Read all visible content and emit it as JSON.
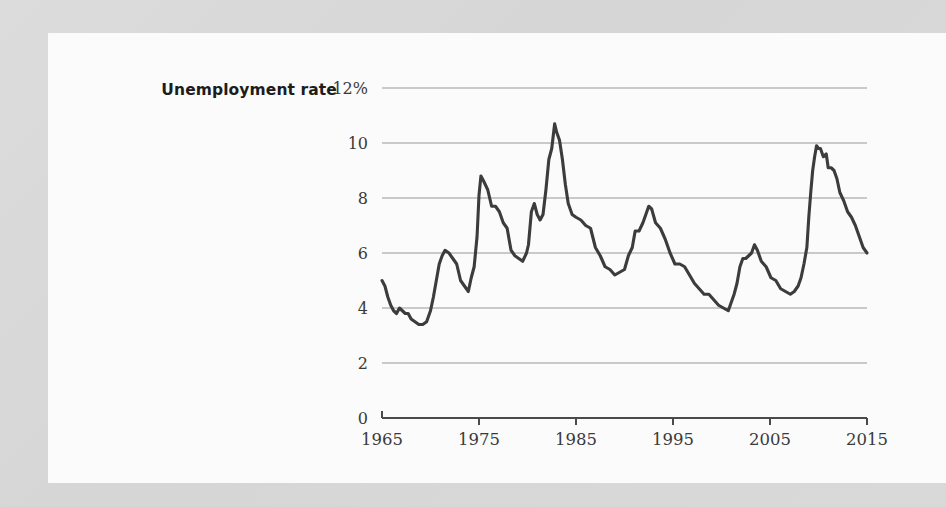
{
  "figure": {
    "background_color": "#d8d8d8",
    "card_color": "#fbfbfb",
    "title": "Unemployment rate"
  },
  "chart_data": {
    "type": "line",
    "title": "Unemployment rate",
    "subtitle": "",
    "xlabel": "",
    "ylabel": "Unemployment rate",
    "y_unit_suffix": "%",
    "xlim": [
      1965,
      2015
    ],
    "ylim": [
      0,
      12
    ],
    "grid": true,
    "legend": false,
    "line_color": "#3c3c3c",
    "grid_color": "#c9c9c9",
    "axis_color": "#4a4a4a",
    "x_ticks": [
      1965,
      1975,
      1985,
      1995,
      2005,
      2015
    ],
    "x_tick_labels": [
      "1965",
      "1975",
      "1985",
      "1995",
      "2005",
      "2015"
    ],
    "y_ticks": [
      0,
      2,
      4,
      6,
      8,
      10,
      12
    ],
    "y_tick_labels": [
      "0",
      "2",
      "4",
      "6",
      "8",
      "10",
      "12%"
    ],
    "series": [
      {
        "name": "Unemployment rate",
        "x": [
          1965.0,
          1965.3,
          1965.6,
          1965.9,
          1966.2,
          1966.5,
          1966.8,
          1967.1,
          1967.4,
          1967.7,
          1968.0,
          1968.4,
          1968.8,
          1969.2,
          1969.6,
          1970.0,
          1970.3,
          1970.6,
          1970.9,
          1971.2,
          1971.5,
          1971.9,
          1972.3,
          1972.7,
          1973.1,
          1973.5,
          1973.9,
          1974.2,
          1974.5,
          1974.8,
          1975.0,
          1975.2,
          1975.5,
          1975.9,
          1976.3,
          1976.7,
          1977.1,
          1977.5,
          1977.9,
          1978.3,
          1978.7,
          1979.1,
          1979.5,
          1979.9,
          1980.1,
          1980.4,
          1980.7,
          1981.0,
          1981.3,
          1981.6,
          1981.9,
          1982.2,
          1982.5,
          1982.8,
          1983.0,
          1983.3,
          1983.6,
          1983.9,
          1984.2,
          1984.6,
          1985.0,
          1985.5,
          1986.0,
          1986.5,
          1987.0,
          1987.5,
          1988.0,
          1988.5,
          1989.0,
          1989.5,
          1990.0,
          1990.4,
          1990.8,
          1991.1,
          1991.5,
          1991.9,
          1992.2,
          1992.5,
          1992.8,
          1993.2,
          1993.7,
          1994.2,
          1994.7,
          1995.2,
          1995.7,
          1996.2,
          1996.7,
          1997.2,
          1997.7,
          1998.2,
          1998.7,
          1999.2,
          1999.7,
          2000.2,
          2000.7,
          2001.0,
          2001.3,
          2001.6,
          2001.9,
          2002.2,
          2002.5,
          2002.8,
          2003.1,
          2003.4,
          2003.7,
          2004.1,
          2004.6,
          2005.1,
          2005.6,
          2006.1,
          2006.6,
          2007.1,
          2007.5,
          2007.9,
          2008.2,
          2008.5,
          2008.8,
          2009.0,
          2009.2,
          2009.4,
          2009.6,
          2009.8,
          2010.0,
          2010.2,
          2010.5,
          2010.8,
          2011.0,
          2011.3,
          2011.6,
          2011.9,
          2012.2,
          2012.6,
          2013.0,
          2013.4,
          2013.8,
          2014.2,
          2014.6,
          2015.0
        ],
        "y": [
          5.0,
          4.8,
          4.4,
          4.1,
          3.9,
          3.8,
          4.0,
          3.9,
          3.8,
          3.8,
          3.6,
          3.5,
          3.4,
          3.4,
          3.5,
          3.9,
          4.4,
          5.0,
          5.6,
          5.9,
          6.1,
          6.0,
          5.8,
          5.6,
          5.0,
          4.8,
          4.6,
          5.1,
          5.5,
          6.6,
          8.1,
          8.8,
          8.6,
          8.3,
          7.7,
          7.7,
          7.5,
          7.1,
          6.9,
          6.1,
          5.9,
          5.8,
          5.7,
          6.0,
          6.3,
          7.5,
          7.8,
          7.4,
          7.2,
          7.4,
          8.3,
          9.4,
          9.8,
          10.7,
          10.4,
          10.1,
          9.4,
          8.5,
          7.8,
          7.4,
          7.3,
          7.2,
          7.0,
          6.9,
          6.2,
          5.9,
          5.5,
          5.4,
          5.2,
          5.3,
          5.4,
          5.9,
          6.2,
          6.8,
          6.8,
          7.1,
          7.4,
          7.7,
          7.6,
          7.1,
          6.9,
          6.5,
          6.0,
          5.6,
          5.6,
          5.5,
          5.2,
          4.9,
          4.7,
          4.5,
          4.5,
          4.3,
          4.1,
          4.0,
          3.9,
          4.2,
          4.5,
          4.9,
          5.5,
          5.8,
          5.8,
          5.9,
          6.0,
          6.3,
          6.1,
          5.7,
          5.5,
          5.1,
          5.0,
          4.7,
          4.6,
          4.5,
          4.6,
          4.8,
          5.1,
          5.6,
          6.2,
          7.3,
          8.2,
          9.0,
          9.5,
          9.9,
          9.8,
          9.8,
          9.5,
          9.6,
          9.1,
          9.1,
          9.0,
          8.7,
          8.2,
          7.9,
          7.5,
          7.3,
          7.0,
          6.6,
          6.2,
          6.0
        ]
      }
    ]
  },
  "plot_geometry": {
    "left": 382,
    "right": 867,
    "top": 88,
    "bottom": 418
  }
}
